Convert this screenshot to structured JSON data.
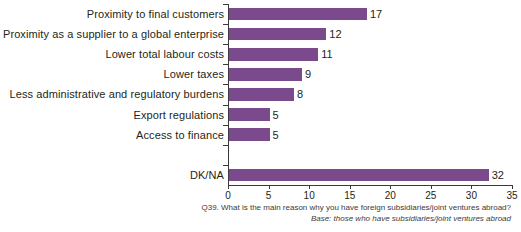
{
  "chart_data": {
    "type": "bar",
    "orientation": "horizontal",
    "title": "",
    "subtitle": "",
    "xlabel": "",
    "ylabel": "",
    "xlim": [
      0,
      35
    ],
    "xticks": [
      0,
      5,
      10,
      15,
      20,
      25,
      30,
      35
    ],
    "grid": false,
    "legend": null,
    "bar_color": "#7a4a8c",
    "categories": [
      "Proximity to final customers",
      "Proximity as a supplier to a global enterprise",
      "Lower total labour costs",
      "Lower taxes",
      "Less administrative and regulatory burdens",
      "Export regulations",
      "Access to finance",
      "",
      "DK/NA"
    ],
    "values": [
      17,
      12,
      11,
      9,
      8,
      5,
      5,
      null,
      32
    ],
    "data_labels": [
      "17",
      "12",
      "11",
      "9",
      "8",
      "5",
      "5",
      "",
      "32"
    ]
  },
  "footnotes": {
    "question": "Q39. What is the main reason why you have foreign subsidiaries/joint ventures abroad?",
    "base": "Base: those who have subsidiaries/joint ventures abroad"
  }
}
